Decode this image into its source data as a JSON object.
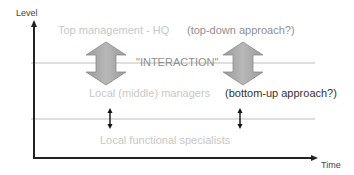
{
  "axes": {
    "y_label": "Level",
    "x_label": "Time"
  },
  "levels": {
    "top": "Top management - HQ",
    "middle": "Local (middle) managers",
    "bottom": "Local functional specialists"
  },
  "annotations": {
    "top_down": "(top-down approach?)",
    "interaction": "\"INTERACTION\"",
    "bottom_up": "(bottom-up approach?)"
  },
  "colors": {
    "axis": "#222222",
    "divider": "#bdbdbd",
    "big_arrow_fill": "#a8a8a8",
    "big_arrow_stroke": "#8a8a8a",
    "faded_text": "#c8c8c8",
    "mid_text": "#8f8f8f",
    "dark_text": "#333333"
  }
}
